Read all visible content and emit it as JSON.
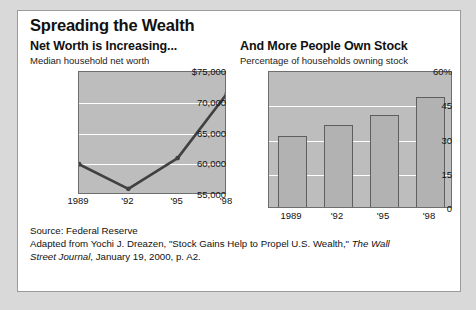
{
  "figure": {
    "title": "Spreading the Wealth",
    "source_line": "Source: Federal Reserve",
    "credit_prefix": "Adapted from Yochi J. Dreazen, \"Stock Gains Help to Propel U.S. Wealth,\" ",
    "credit_italic_1": "The Wall",
    "credit_italic_2": "Street Journal",
    "credit_suffix": ", January 19, 2000, p. A2."
  },
  "chart_data": [
    {
      "id": "net-worth",
      "type": "line",
      "title": "Net Worth is Increasing...",
      "subtitle": "Median household net worth",
      "xlabel": "",
      "ylabel": "",
      "categories": [
        "1989",
        "'92",
        "'95",
        "'98"
      ],
      "values": [
        60000,
        56000,
        61000,
        71500
      ],
      "ytick_labels": [
        "$75,000",
        "70,000",
        "65,000",
        "60,000",
        "55,000"
      ],
      "ytick_values": [
        75000,
        70000,
        65000,
        60000,
        55000
      ],
      "ylim": [
        55000,
        75000
      ],
      "grid": true,
      "legend": "none",
      "line_color": "#404040",
      "plot_bg": "#bdbdbd"
    },
    {
      "id": "stock-ownership",
      "type": "bar",
      "title": "And More People Own Stock",
      "subtitle": "Percentage of households owning stock",
      "xlabel": "",
      "ylabel": "",
      "categories": [
        "1989",
        "'92",
        "'95",
        "'98"
      ],
      "values": [
        32,
        37,
        41,
        49
      ],
      "ytick_labels": [
        "60%",
        "45",
        "30",
        "15",
        "0"
      ],
      "ytick_values": [
        60,
        45,
        30,
        15,
        0
      ],
      "ylim": [
        0,
        60
      ],
      "grid": true,
      "legend": "none",
      "bar_color": "#b2b2b2",
      "plot_bg": "#bdbdbd"
    }
  ]
}
